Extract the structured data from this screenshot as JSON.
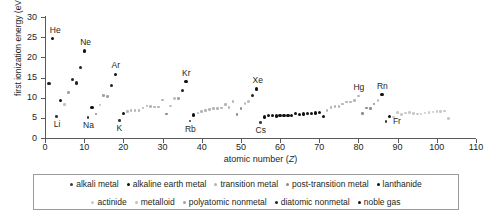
{
  "chart_data": {
    "type": "scatter",
    "title": "",
    "xlabel": "atomic number (Z)",
    "ylabel": "first ionization energy (eV)",
    "xlim": [
      0,
      110
    ],
    "ylim": [
      0,
      30
    ],
    "xticks": [
      0,
      10,
      20,
      30,
      40,
      50,
      60,
      70,
      80,
      90,
      100,
      110
    ],
    "yticks": [
      0,
      5,
      10,
      15,
      20,
      25,
      30
    ],
    "grid": false,
    "legend_position": "bottom",
    "point_labels": [
      {
        "text": "He",
        "x": 2,
        "y": 24.6
      },
      {
        "text": "Li",
        "x": 3,
        "y": 5.39
      },
      {
        "text": "Ne",
        "x": 10,
        "y": 21.6
      },
      {
        "text": "Na",
        "x": 11,
        "y": 5.14
      },
      {
        "text": "Ar",
        "x": 18,
        "y": 15.8
      },
      {
        "text": "K",
        "x": 19,
        "y": 4.34
      },
      {
        "text": "Kr",
        "x": 36,
        "y": 14.0
      },
      {
        "text": "Rb",
        "x": 37,
        "y": 4.18
      },
      {
        "text": "Xe",
        "x": 54,
        "y": 12.1
      },
      {
        "text": "Cs",
        "x": 55,
        "y": 3.89
      },
      {
        "text": "Hg",
        "x": 80,
        "y": 10.4
      },
      {
        "text": "Rn",
        "x": 86,
        "y": 10.7
      },
      {
        "text": "Fr",
        "x": 87,
        "y": 4.07
      }
    ],
    "series": [
      {
        "name": "alkali metal",
        "color": "#3b3b3b",
        "points": [
          [
            3,
            5.39
          ],
          [
            11,
            5.14
          ],
          [
            19,
            4.34
          ],
          [
            37,
            4.18
          ],
          [
            55,
            3.89
          ],
          [
            87,
            4.07
          ]
        ]
      },
      {
        "name": "alkaline earth metal",
        "color": "#111111",
        "points": [
          [
            4,
            9.32
          ],
          [
            12,
            7.65
          ],
          [
            20,
            6.11
          ],
          [
            38,
            5.69
          ],
          [
            56,
            5.21
          ],
          [
            88,
            5.28
          ]
        ]
      },
      {
        "name": "transition metal",
        "color": "#b4b4b4",
        "points": [
          [
            21,
            6.56
          ],
          [
            22,
            6.83
          ],
          [
            23,
            6.75
          ],
          [
            24,
            6.77
          ],
          [
            25,
            7.43
          ],
          [
            26,
            7.9
          ],
          [
            27,
            7.88
          ],
          [
            28,
            7.64
          ],
          [
            29,
            7.73
          ],
          [
            30,
            9.39
          ],
          [
            39,
            6.22
          ],
          [
            40,
            6.63
          ],
          [
            41,
            6.76
          ],
          [
            42,
            7.09
          ],
          [
            43,
            7.28
          ],
          [
            44,
            7.36
          ],
          [
            45,
            7.46
          ],
          [
            46,
            8.34
          ],
          [
            47,
            7.58
          ],
          [
            48,
            8.99
          ],
          [
            72,
            6.83
          ],
          [
            73,
            7.55
          ],
          [
            74,
            7.86
          ],
          [
            75,
            7.83
          ],
          [
            76,
            8.44
          ],
          [
            77,
            8.97
          ],
          [
            78,
            8.96
          ],
          [
            79,
            9.23
          ],
          [
            80,
            10.44
          ]
        ]
      },
      {
        "name": "post-transition metal",
        "color": "#8c8c8c",
        "points": [
          [
            13,
            5.99
          ],
          [
            31,
            6.0
          ],
          [
            49,
            5.79
          ],
          [
            50,
            7.34
          ],
          [
            81,
            6.11
          ],
          [
            82,
            7.42
          ],
          [
            83,
            7.29
          ],
          [
            84,
            8.41
          ],
          [
            113,
            0
          ]
        ]
      },
      {
        "name": "lanthanide",
        "color": "#111111",
        "points": [
          [
            57,
            5.58
          ],
          [
            58,
            5.54
          ],
          [
            59,
            5.47
          ],
          [
            60,
            5.53
          ],
          [
            61,
            5.58
          ],
          [
            62,
            5.64
          ],
          [
            63,
            5.67
          ],
          [
            64,
            6.15
          ],
          [
            65,
            5.86
          ],
          [
            66,
            5.94
          ],
          [
            67,
            6.02
          ],
          [
            68,
            6.11
          ],
          [
            69,
            6.18
          ],
          [
            70,
            6.25
          ],
          [
            71,
            5.43
          ]
        ]
      },
      {
        "name": "actinide",
        "color": "#c8c8c8",
        "points": [
          [
            89,
            5.17
          ],
          [
            90,
            6.31
          ],
          [
            91,
            5.89
          ],
          [
            92,
            6.19
          ],
          [
            93,
            6.27
          ],
          [
            94,
            6.03
          ],
          [
            95,
            5.97
          ],
          [
            96,
            5.99
          ],
          [
            97,
            6.2
          ],
          [
            98,
            6.28
          ],
          [
            99,
            6.42
          ],
          [
            100,
            6.5
          ],
          [
            101,
            6.58
          ],
          [
            102,
            6.65
          ],
          [
            103,
            4.9
          ]
        ]
      },
      {
        "name": "metalloid",
        "color": "#c0c0c0",
        "points": [
          [
            5,
            8.3
          ],
          [
            14,
            8.15
          ],
          [
            32,
            7.9
          ],
          [
            33,
            9.79
          ],
          [
            51,
            8.61
          ],
          [
            52,
            9.01
          ],
          [
            85,
            9.32
          ]
        ]
      },
      {
        "name": "polyatomic nonmetal",
        "color": "#a0a0a0",
        "points": [
          [
            6,
            11.26
          ],
          [
            15,
            10.49
          ],
          [
            16,
            10.36
          ],
          [
            34,
            9.75
          ]
        ]
      },
      {
        "name": "diatomic nonmetal",
        "color": "#222222",
        "points": [
          [
            1,
            13.6
          ],
          [
            7,
            14.53
          ],
          [
            8,
            13.62
          ],
          [
            9,
            17.42
          ],
          [
            17,
            12.97
          ],
          [
            35,
            11.81
          ],
          [
            53,
            10.45
          ]
        ]
      },
      {
        "name": "noble gas",
        "color": "#111111",
        "points": [
          [
            2,
            24.59
          ],
          [
            10,
            21.56
          ],
          [
            18,
            15.76
          ],
          [
            36,
            14.0
          ],
          [
            54,
            12.13
          ],
          [
            86,
            10.75
          ]
        ]
      }
    ]
  },
  "legend": {
    "rows": [
      [
        {
          "label": "alkali metal",
          "color": "#3b3b3b"
        },
        {
          "label": "alkaline earth metal",
          "color": "#111111"
        },
        {
          "label": "transition metal",
          "color": "#b4b4b4"
        },
        {
          "label": "post-transition metal",
          "color": "#8c8c8c"
        },
        {
          "label": "lanthanide",
          "color": "#111111"
        }
      ],
      [
        {
          "label": "actinide",
          "color": "#c8c8c8"
        },
        {
          "label": "metalloid",
          "color": "#c0c0c0"
        },
        {
          "label": "polyatomic nonmetal",
          "color": "#a0a0a0"
        },
        {
          "label": "diatomic nonmetal",
          "color": "#222222"
        },
        {
          "label": "noble gas",
          "color": "#111111"
        }
      ]
    ]
  }
}
